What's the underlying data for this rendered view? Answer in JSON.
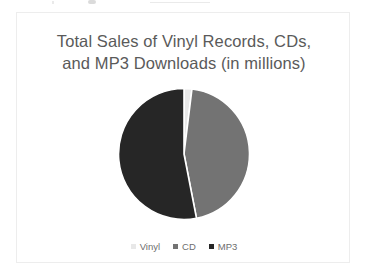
{
  "card": {
    "background": "#ffffff",
    "border_color": "#ededed"
  },
  "chart_data": {
    "type": "pie",
    "title": "Total Sales of Vinyl Records, CDs, and MP3 Downloads (in millions)",
    "title_lines": [
      "Total Sales of Vinyl Records, CDs,",
      "and MP3 Downloads (in millions)"
    ],
    "title_color": "#5a5a5a",
    "xlabel": "",
    "ylabel": "",
    "grid": false,
    "legend_position": "bottom",
    "start_angle_deg": 0,
    "direction": "clockwise",
    "units": "millions",
    "categories": [
      "Vinyl",
      "CD",
      "MP3"
    ],
    "values": [
      2,
      45,
      53
    ],
    "percentages": [
      2,
      45,
      53
    ],
    "angles_deg": [
      7,
      162,
      191
    ],
    "colors": [
      "#e8e8e8",
      "#737373",
      "#262626"
    ],
    "slices": [
      {
        "label": "Vinyl",
        "value": 2,
        "percent": 2,
        "angle_deg": 7,
        "color": "#e8e8e8"
      },
      {
        "label": "CD",
        "value": 45,
        "percent": 45,
        "angle_deg": 162,
        "color": "#737373"
      },
      {
        "label": "MP3",
        "value": 53,
        "percent": 53,
        "angle_deg": 191,
        "color": "#262626"
      }
    ],
    "legend": [
      {
        "label": "Vinyl",
        "color": "#e8e8e8"
      },
      {
        "label": "CD",
        "color": "#737373"
      },
      {
        "label": "MP3",
        "color": "#262626"
      }
    ]
  }
}
